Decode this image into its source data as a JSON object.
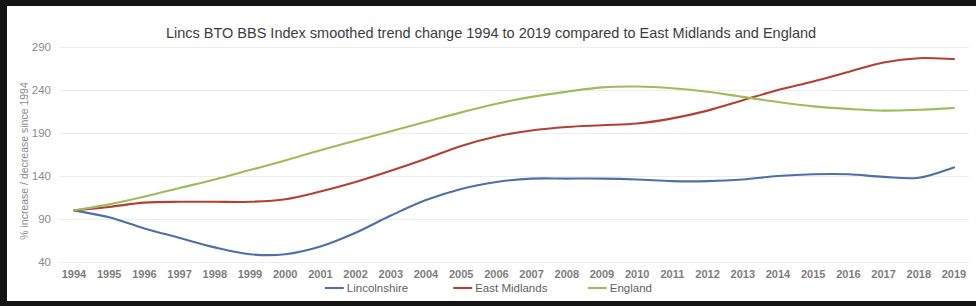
{
  "figure": {
    "title": "Lincs BTO BBS Index smoothed trend change 1994 to 2019 compared to East Midlands and England",
    "y_axis_title": "% increase / decrease since 1994"
  },
  "legend": {
    "items": [
      {
        "label": "Lincolnshire",
        "color": "#4f6fa8"
      },
      {
        "label": "East Midlands",
        "color": "#b43f32"
      },
      {
        "label": "England",
        "color": "#9dbd5a"
      }
    ]
  },
  "chart_data": {
    "type": "line",
    "title": "Lincs BTO BBS Index smoothed trend change 1994 to 2019 compared to East Midlands and England",
    "xlabel": "",
    "ylabel": "% increase / decrease since 1994",
    "ylim": [
      40,
      290
    ],
    "yticks": [
      40,
      90,
      140,
      190,
      240,
      290
    ],
    "grid": true,
    "legend_position": "bottom",
    "categories": [
      "1994",
      "1995",
      "1996",
      "1997",
      "1998",
      "1999",
      "2000",
      "2001",
      "2002",
      "2003",
      "2004",
      "2005",
      "2006",
      "2007",
      "2008",
      "2009",
      "2010",
      "2011",
      "2012",
      "2013",
      "2014",
      "2015",
      "2016",
      "2017",
      "2018",
      "2019"
    ],
    "x": [
      1994,
      1995,
      1996,
      1997,
      1998,
      1999,
      2000,
      2001,
      2002,
      2003,
      2004,
      2005,
      2006,
      2007,
      2008,
      2009,
      2010,
      2011,
      2012,
      2013,
      2014,
      2015,
      2016,
      2017,
      2018,
      2019
    ],
    "series": [
      {
        "name": "Lincolnshire",
        "color": "#4f6fa8",
        "values": [
          100,
          92,
          79,
          68,
          57,
          49,
          49,
          58,
          74,
          94,
          112,
          125,
          133,
          137,
          137,
          137,
          136,
          134,
          134,
          136,
          140,
          142,
          142,
          139,
          138,
          150
        ]
      },
      {
        "name": "East Midlands",
        "color": "#b43f32",
        "values": [
          100,
          104,
          109,
          110,
          110,
          110,
          113,
          122,
          133,
          146,
          160,
          175,
          186,
          193,
          197,
          199,
          201,
          207,
          216,
          228,
          240,
          250,
          261,
          272,
          277,
          276
        ]
      },
      {
        "name": "England",
        "color": "#9dbd5a",
        "values": [
          100,
          107,
          116,
          126,
          136,
          147,
          158,
          170,
          181,
          192,
          203,
          214,
          224,
          232,
          238,
          243,
          244,
          242,
          238,
          232,
          226,
          221,
          218,
          216,
          217,
          219
        ]
      }
    ]
  }
}
